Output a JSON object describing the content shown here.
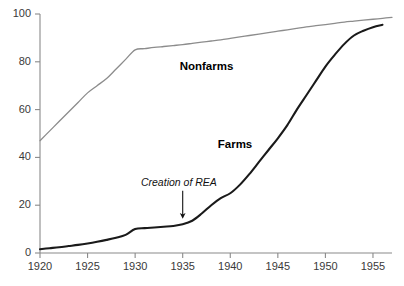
{
  "chart_data": {
    "type": "line",
    "title": "",
    "subtitle": "",
    "xlabel": "",
    "ylabel": "",
    "xlim": [
      1920,
      1957
    ],
    "ylim": [
      0,
      100
    ],
    "grid": false,
    "legend_position": "inline-labels",
    "x_ticks": [
      1920,
      1925,
      1930,
      1935,
      1940,
      1945,
      1950,
      1955
    ],
    "x_tick_labels": [
      "1920",
      "1925",
      "1930",
      "1935",
      "1940",
      "1945",
      "1950",
      "1955"
    ],
    "y_ticks": [
      0,
      20,
      40,
      60,
      80,
      100
    ],
    "y_tick_labels": [
      "0",
      "20",
      "40",
      "60",
      "80",
      "100"
    ],
    "series": [
      {
        "name": "Nonfarms",
        "color": "#8c8c8c",
        "label_x": 1937.5,
        "label_y": 78,
        "x": [
          1920,
          1921,
          1922,
          1923,
          1924,
          1925,
          1926,
          1927,
          1928,
          1929,
          1930,
          1931,
          1932,
          1933,
          1934,
          1935,
          1936,
          1937,
          1938,
          1939,
          1940,
          1941,
          1942,
          1943,
          1944,
          1945,
          1946,
          1947,
          1948,
          1949,
          1950,
          1951,
          1952,
          1953,
          1954,
          1955,
          1956,
          1957
        ],
        "values": [
          47,
          51,
          55,
          59,
          63,
          67,
          70,
          73,
          77,
          81,
          85,
          85.5,
          86,
          86.4,
          86.8,
          87.2,
          87.7,
          88.2,
          88.7,
          89.2,
          89.8,
          90.4,
          91,
          91.6,
          92.2,
          92.8,
          93.4,
          94,
          94.6,
          95.1,
          95.6,
          96.1,
          96.6,
          97,
          97.4,
          97.8,
          98.2,
          98.6
        ]
      },
      {
        "name": "Farms",
        "color": "#1a1a1a",
        "label_x": 1940.5,
        "label_y": 45,
        "x": [
          1920,
          1921,
          1922,
          1923,
          1924,
          1925,
          1926,
          1927,
          1928,
          1929,
          1930,
          1931,
          1932,
          1933,
          1934,
          1935,
          1936,
          1937,
          1938,
          1939,
          1940,
          1941,
          1942,
          1943,
          1944,
          1945,
          1946,
          1947,
          1948,
          1949,
          1950,
          1951,
          1952,
          1953,
          1954,
          1955,
          1956
        ],
        "values": [
          1.6,
          2.0,
          2.4,
          2.9,
          3.4,
          4.0,
          4.7,
          5.5,
          6.4,
          7.6,
          10.0,
          10.4,
          10.7,
          11.0,
          11.3,
          12.0,
          13.5,
          16.5,
          20.0,
          23.0,
          25.0,
          28.5,
          33.0,
          38.0,
          43.0,
          48.0,
          53.5,
          60.0,
          66.0,
          72.0,
          78.0,
          83.0,
          87.5,
          91.0,
          93.0,
          94.5,
          95.5
        ]
      }
    ],
    "annotations": [
      {
        "text": "Creation of REA",
        "x": 1935,
        "label_x": 1934.6,
        "label_y": 29,
        "arrow_from_y": 26,
        "arrow_to_y": 15.5
      }
    ]
  }
}
